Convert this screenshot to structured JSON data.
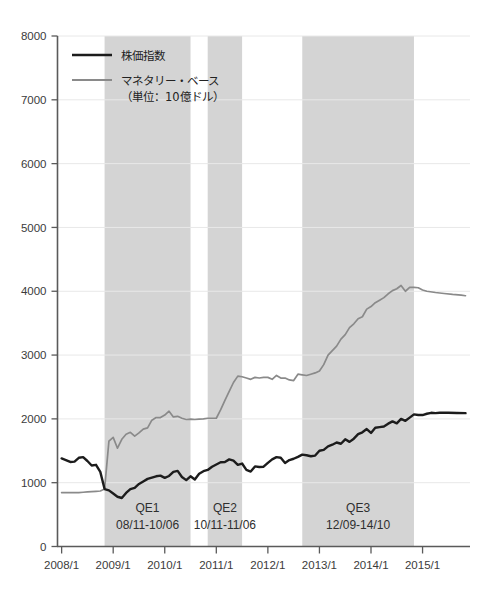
{
  "chart_data": {
    "type": "line",
    "title": "",
    "subtitle": "",
    "xlabel": "",
    "ylabel": "",
    "ylim": [
      0,
      8000
    ],
    "ytick_labels": [
      "0",
      "1000",
      "2000",
      "3000",
      "4000",
      "5000",
      "6000",
      "7000",
      "8000"
    ],
    "yticks": [
      0,
      1000,
      2000,
      3000,
      4000,
      5000,
      6000,
      7000,
      8000
    ],
    "xtick_labels": [
      "2008/1",
      "2009/1",
      "2010/1",
      "2011/1",
      "2012/1",
      "2013/1",
      "2014/1",
      "2015/1"
    ],
    "xticks": [
      2008.0,
      2009.0,
      2010.0,
      2011.0,
      2012.0,
      2013.0,
      2014.0,
      2015.0
    ],
    "xlim": [
      2007.92,
      2015.92
    ],
    "grid": "horizontal",
    "legend_position": "top-left",
    "series": [
      {
        "name": "株価指数",
        "color": "#1c1c1c",
        "width": 2.4,
        "x": [
          2008.0,
          2008.083,
          2008.167,
          2008.25,
          2008.333,
          2008.417,
          2008.5,
          2008.583,
          2008.667,
          2008.75,
          2008.833,
          2008.917,
          2009.0,
          2009.083,
          2009.167,
          2009.25,
          2009.333,
          2009.417,
          2009.5,
          2009.583,
          2009.667,
          2009.75,
          2009.833,
          2009.917,
          2010.0,
          2010.083,
          2010.167,
          2010.25,
          2010.333,
          2010.417,
          2010.5,
          2010.583,
          2010.667,
          2010.75,
          2010.833,
          2010.917,
          2011.0,
          2011.083,
          2011.167,
          2011.25,
          2011.333,
          2011.417,
          2011.5,
          2011.583,
          2011.667,
          2011.75,
          2011.833,
          2011.917,
          2012.0,
          2012.083,
          2012.167,
          2012.25,
          2012.333,
          2012.417,
          2012.5,
          2012.583,
          2012.667,
          2012.75,
          2012.833,
          2012.917,
          2013.0,
          2013.083,
          2013.167,
          2013.25,
          2013.333,
          2013.417,
          2013.5,
          2013.583,
          2013.667,
          2013.75,
          2013.833,
          2013.917,
          2014.0,
          2014.083,
          2014.167,
          2014.25,
          2014.333,
          2014.417,
          2014.5,
          2014.583,
          2014.667,
          2014.75,
          2014.833,
          2014.917,
          2015.0,
          2015.083,
          2015.167,
          2015.25,
          2015.333,
          2015.5,
          2015.667,
          2015.833
        ],
        "values": [
          1380,
          1355,
          1325,
          1330,
          1390,
          1400,
          1340,
          1270,
          1280,
          1170,
          900,
          880,
          830,
          780,
          760,
          840,
          900,
          920,
          980,
          1020,
          1060,
          1080,
          1100,
          1110,
          1075,
          1105,
          1170,
          1185,
          1090,
          1040,
          1100,
          1050,
          1140,
          1180,
          1200,
          1250,
          1285,
          1320,
          1325,
          1365,
          1345,
          1280,
          1300,
          1200,
          1175,
          1255,
          1245,
          1250,
          1310,
          1365,
          1400,
          1390,
          1310,
          1355,
          1375,
          1405,
          1440,
          1430,
          1415,
          1425,
          1500,
          1515,
          1570,
          1595,
          1630,
          1610,
          1680,
          1640,
          1690,
          1760,
          1790,
          1840,
          1780,
          1860,
          1870,
          1880,
          1925,
          1960,
          1930,
          2000,
          1970,
          2020,
          2070,
          2060,
          2060,
          2080,
          2095,
          2090,
          2095,
          2095,
          2092,
          2090
        ]
      },
      {
        "name": "マネタリー・ベース（単位：10億ドル）",
        "color": "#8a8a8a",
        "width": 1.7,
        "x": [
          2008.0,
          2008.083,
          2008.167,
          2008.25,
          2008.333,
          2008.417,
          2008.5,
          2008.583,
          2008.667,
          2008.75,
          2008.833,
          2008.917,
          2009.0,
          2009.083,
          2009.167,
          2009.25,
          2009.333,
          2009.417,
          2009.5,
          2009.583,
          2009.667,
          2009.75,
          2009.833,
          2009.917,
          2010.0,
          2010.083,
          2010.167,
          2010.25,
          2010.333,
          2010.417,
          2010.5,
          2010.583,
          2010.667,
          2010.75,
          2010.833,
          2010.917,
          2011.0,
          2011.083,
          2011.167,
          2011.25,
          2011.333,
          2011.417,
          2011.5,
          2011.583,
          2011.667,
          2011.75,
          2011.833,
          2011.917,
          2012.0,
          2012.083,
          2012.167,
          2012.25,
          2012.333,
          2012.417,
          2012.5,
          2012.583,
          2012.667,
          2012.75,
          2012.833,
          2012.917,
          2013.0,
          2013.083,
          2013.167,
          2013.25,
          2013.333,
          2013.417,
          2013.5,
          2013.583,
          2013.667,
          2013.75,
          2013.833,
          2013.917,
          2014.0,
          2014.083,
          2014.167,
          2014.25,
          2014.333,
          2014.417,
          2014.5,
          2014.583,
          2014.667,
          2014.75,
          2014.833,
          2014.917,
          2015.0,
          2015.083,
          2015.25,
          2015.417,
          2015.583,
          2015.75,
          2015.833
        ],
        "values": [
          845,
          845,
          845,
          845,
          845,
          850,
          855,
          860,
          865,
          870,
          900,
          1650,
          1710,
          1540,
          1680,
          1760,
          1790,
          1730,
          1780,
          1840,
          1860,
          1980,
          2020,
          2020,
          2060,
          2120,
          2030,
          2040,
          2010,
          1990,
          1995,
          1990,
          1995,
          2000,
          2010,
          2010,
          2010,
          2140,
          2290,
          2430,
          2570,
          2670,
          2660,
          2640,
          2620,
          2650,
          2640,
          2650,
          2650,
          2620,
          2680,
          2640,
          2640,
          2610,
          2600,
          2700,
          2690,
          2680,
          2700,
          2720,
          2750,
          2850,
          3000,
          3070,
          3140,
          3250,
          3320,
          3430,
          3490,
          3570,
          3600,
          3720,
          3760,
          3820,
          3860,
          3900,
          3960,
          4010,
          4040,
          4090,
          4000,
          4060,
          4060,
          4055,
          4020,
          4000,
          3980,
          3965,
          3950,
          3940,
          3930
        ]
      }
    ],
    "shaded_bands": [
      {
        "name": "QE1",
        "title": "QE1",
        "range_label": "08/11-10/06",
        "x_start": 2008.833,
        "x_end": 2010.5,
        "color": "#d4d4d4"
      },
      {
        "name": "QE2",
        "title": "QE2",
        "range_label": "10/11-11/06",
        "x_start": 2010.833,
        "x_end": 2011.5,
        "color": "#d4d4d4"
      },
      {
        "name": "QE3",
        "title": "QE3",
        "range_label": "12/09-14/10",
        "x_start": 2012.667,
        "x_end": 2014.833,
        "color": "#d4d4d4"
      }
    ]
  },
  "legend": {
    "entries": [
      {
        "label": "株価指数",
        "color": "#1c1c1c"
      },
      {
        "label": "マネタリー・ベース",
        "color": "#8a8a8a"
      }
    ],
    "sub_label": "（単位：10億ドル）"
  },
  "colors": {
    "stock_line": "#1c1c1c",
    "monetary_line": "#8a8a8a",
    "band": "#d4d4d4",
    "axis": "#5a5a5a",
    "gridline": "#e8e8e8",
    "text": "#3b3b3b",
    "background": "#ffffff"
  }
}
